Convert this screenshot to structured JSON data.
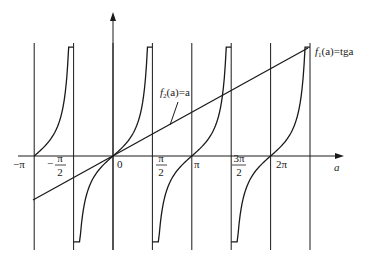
{
  "diagram": {
    "type": "function-plot",
    "axes": {
      "x_label": "a",
      "y_label": ""
    },
    "tick_labels": [
      {
        "id": "neg-pi",
        "text": "−π",
        "value": -3.14159
      },
      {
        "id": "neg-half-pi",
        "sign": "−",
        "num": "π",
        "den": "2",
        "value": -1.5708
      },
      {
        "id": "zero",
        "text": "0",
        "value": 0
      },
      {
        "id": "half-pi",
        "num": "π",
        "den": "2",
        "value": 1.5708
      },
      {
        "id": "pi",
        "text": "π",
        "value": 3.14159
      },
      {
        "id": "three-half-pi",
        "num": "3π",
        "den": "2",
        "value": 4.7124
      },
      {
        "id": "two-pi",
        "text": "2π",
        "value": 6.28319
      }
    ],
    "curves": [
      {
        "id": "f1",
        "label_f": "f",
        "label_sub": "1",
        "label_rest": "(a)=tga",
        "description": "tangent branches"
      },
      {
        "id": "f2",
        "label_f": "f",
        "label_sub": "2",
        "label_rest": "(a)=a",
        "description": "straight line"
      }
    ],
    "colors": {
      "stroke": "#1a1a1a",
      "background": "#ffffff"
    }
  },
  "chart_data": {
    "type": "line",
    "title": "",
    "xlabel": "a",
    "ylabel": "",
    "x_ticks": [
      "−π",
      "−π/2",
      "0",
      "π/2",
      "π",
      "3π/2",
      "2π"
    ],
    "vertical_lines_at": [
      -3.14159,
      -1.5708,
      0,
      1.5708,
      3.14159,
      4.7124,
      6.28319,
      7.854
    ],
    "series": [
      {
        "name": "f1(a)=tga",
        "kind": "tangent-like branches, zero at −π, 0, π, 2π, asymptotes at −π/2, π/2, 3π/2, 5π/2"
      },
      {
        "name": "f2(a)=a",
        "kind": "straight line from a=−π to a≈5π/2 passing through origin"
      }
    ],
    "grid": false,
    "legend": "inline labels"
  }
}
